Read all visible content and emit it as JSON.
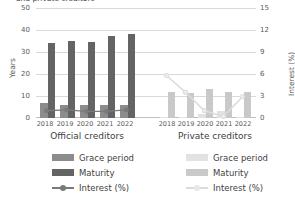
{
  "chart_data": {
    "type": "bar",
    "title": "and private creditors",
    "x": [
      "2018",
      "2019",
      "2020",
      "2021",
      "2022"
    ],
    "ylabel_left": "Years",
    "ylabel_right": "Interest (%)",
    "ylim_left": [
      0,
      50
    ],
    "ylim_right": [
      0,
      15
    ],
    "yticks_left": [
      "0",
      "10",
      "20",
      "30",
      "40",
      "50"
    ],
    "yticks_right": [
      "0",
      "3",
      "6",
      "9",
      "12",
      "15"
    ],
    "grid": true,
    "legend_position": "bottom",
    "groups": [
      {
        "name": "Official creditors",
        "label": "Official creditors",
        "series": [
          {
            "name": "Grace period",
            "axis": "left",
            "type": "bar",
            "color": "#8c8c8c",
            "values": [
              6.8,
              6.0,
              5.8,
              6.0,
              6.0
            ]
          },
          {
            "name": "Maturity",
            "axis": "left",
            "type": "bar",
            "color": "#646464",
            "values": [
              34.0,
              35.0,
              34.5,
              37.5,
              38.0
            ]
          },
          {
            "name": "Interest (%)",
            "axis": "right",
            "type": "line",
            "color": "#7a7a7a",
            "values": [
              1.0,
              1.1,
              0.9,
              0.9,
              1.1
            ]
          }
        ]
      },
      {
        "name": "Private creditors",
        "label": "Private creditors",
        "series": [
          {
            "name": "Grace period",
            "axis": "left",
            "type": "bar",
            "color": "#e2e2e2",
            "values": [
              0.4,
              0.4,
              1.6,
              3.0,
              0.4
            ]
          },
          {
            "name": "Maturity",
            "axis": "left",
            "type": "bar",
            "color": "#c9c9c9",
            "values": [
              12.0,
              11.5,
              13.0,
              12.0,
              12.0
            ]
          },
          {
            "name": "Interest (%)",
            "axis": "right",
            "type": "line",
            "color": "#dcdcdc",
            "values": [
              5.8,
              3.5,
              1.0,
              0.2,
              2.9
            ]
          }
        ]
      }
    ]
  },
  "axes": {
    "left_label": "Years",
    "right_label": "Interest (%)",
    "left_ticks": [
      "50",
      "40",
      "30",
      "20",
      "10",
      "0"
    ],
    "right_ticks": [
      "15",
      "12",
      "9",
      "6",
      "3",
      "0"
    ]
  },
  "xlabels": {
    "official": [
      "2018",
      "2019",
      "2020",
      "2021",
      "2022"
    ],
    "private": [
      "2018",
      "2019",
      "2020",
      "2021",
      "2022"
    ]
  },
  "group_labels": {
    "official": "Official creditors",
    "private": "Private creditors"
  },
  "legend": {
    "official": [
      {
        "label": "Grace period",
        "kind": "swatch",
        "color": "#8c8c8c"
      },
      {
        "label": "Maturity",
        "kind": "swatch",
        "color": "#646464"
      },
      {
        "label": "Interest (%)",
        "kind": "line",
        "color": "#7a7a7a"
      }
    ],
    "private": [
      {
        "label": "Grace period",
        "kind": "swatch",
        "color": "#e2e2e2"
      },
      {
        "label": "Maturity",
        "kind": "swatch",
        "color": "#c9c9c9"
      },
      {
        "label": "Interest (%)",
        "kind": "line",
        "color": "#dcdcdc"
      }
    ]
  },
  "title": "and private creditors"
}
